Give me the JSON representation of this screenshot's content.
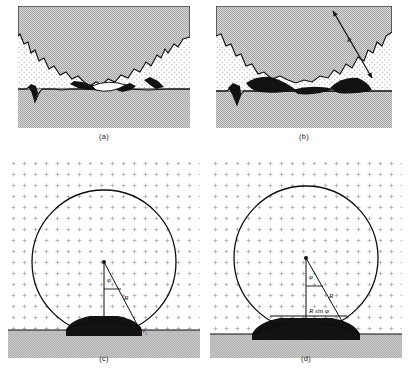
{
  "figure": {
    "domain": "scientific-diagram",
    "title_visible": false,
    "layout": "2x2 panel grid",
    "width": 410,
    "height": 381
  },
  "colors": {
    "grain_gray": "#c9c9c9",
    "pore_white": "#ffffff",
    "liquid_black": "#121212",
    "substrate_gray": "#c9c9c9",
    "stroke": "#0d0d0d",
    "dot_texture": "#9b9b9b"
  },
  "panels": [
    {
      "id": "a",
      "caption": "(a)",
      "type": "micrograph-schematic",
      "description": "cross-section of porous compact on substrate, gray grain, white dotted pores, thin black wetting films and an isolated white pore at the interface",
      "annotations": []
    },
    {
      "id": "b",
      "caption": "(b)",
      "type": "micrograph-schematic",
      "description": "same cross-section with thick black liquid phase spread along the substrate interface and a double-headed arrow indicating radius of curvature",
      "annotations": [
        {
          "name": "radius-arrow-label",
          "text": "R",
          "style": "italic",
          "arrow": "double-headed"
        }
      ]
    },
    {
      "id": "c",
      "caption": "(c)",
      "type": "geometric-model",
      "description": "spherical particle resting on substrate within dotted matrix, center marked, radius R drawn to contact edge, vertical distance x from center to substrate, contact angle d at base and interface radius r_i at the contact point",
      "annotations": [
        {
          "name": "angle-phi",
          "text": "φ",
          "style": "italic"
        },
        {
          "name": "radius-R",
          "text": "R",
          "style": "italic"
        },
        {
          "name": "distance-x",
          "text": "x",
          "style": "italic"
        },
        {
          "name": "base-d",
          "text": "d",
          "style": "italic"
        },
        {
          "name": "interface-radius",
          "text": "r",
          "subscript": "i",
          "style": "italic"
        }
      ]
    },
    {
      "id": "d",
      "caption": "(d)",
      "type": "geometric-model",
      "description": "same spherical particle with chord labelled R sin phi, contact angle theta on the left meniscus, base dimensions d and D stacked at the centre line, radius R and interface radius r_i",
      "annotations": [
        {
          "name": "angle-phi",
          "text": "φ",
          "style": "italic"
        },
        {
          "name": "radius-R",
          "text": "R",
          "style": "italic"
        },
        {
          "name": "chord-label",
          "text": "R sin φ",
          "style": "italic-mixed"
        },
        {
          "name": "angle-theta",
          "text": "θ",
          "style": "italic"
        },
        {
          "name": "base-d",
          "text": "d",
          "style": "italic"
        },
        {
          "name": "base-D",
          "text": "D",
          "style": "italic"
        },
        {
          "name": "interface-radius",
          "text": "r",
          "subscript": "i",
          "style": "italic"
        }
      ]
    }
  ],
  "symbols": {
    "phi": "φ",
    "theta": "θ",
    "R": "R",
    "x": "x",
    "d": "d",
    "D": "D",
    "r": "r",
    "i": "i",
    "R_sin_phi": "R sin φ"
  },
  "captions": {
    "a": "(a)",
    "b": "(b)",
    "c": "(c)",
    "d": "(d)"
  }
}
